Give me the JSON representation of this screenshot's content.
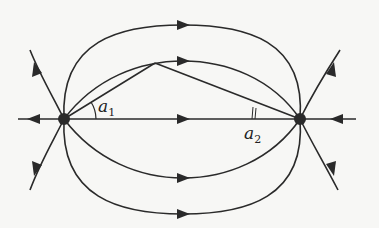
{
  "diagram": {
    "colors": {
      "stroke": "#2a2a2a",
      "background": "#f7f7f5"
    },
    "nodes": [
      {
        "id": "left-node",
        "x": 64,
        "y": 119
      },
      {
        "id": "right-node",
        "x": 300,
        "y": 119
      }
    ],
    "labels": {
      "a1": {
        "base": "a",
        "sub": "1"
      },
      "a2": {
        "base": "a",
        "sub": "2"
      }
    }
  }
}
